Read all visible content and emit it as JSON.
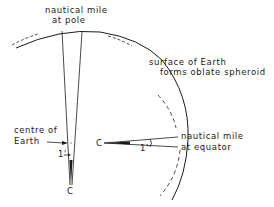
{
  "diagram": {
    "labels": {
      "pole_line1": "nautical mile",
      "pole_line2": "at pole",
      "surface_line1": "surface of Earth",
      "surface_line2": "forms oblate spheroid",
      "centre_line1": "centre of",
      "centre_line2": "Earth",
      "equator_line1": "nautical mile",
      "equator_line2": "at equator",
      "c_pole": "C",
      "c_equator": "C",
      "angle_pole": "1'",
      "angle_equator": "1'"
    },
    "colors": {
      "ink": "#1a1a1a",
      "background": "#ffffff"
    }
  }
}
